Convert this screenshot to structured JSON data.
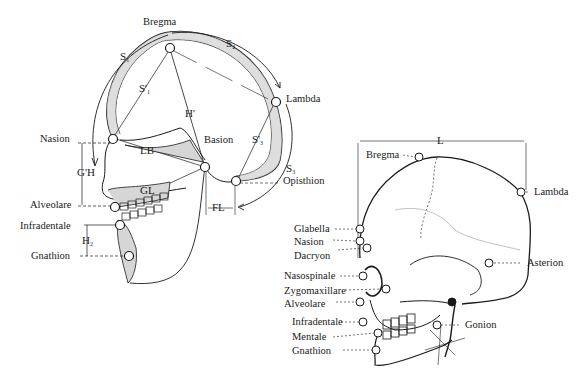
{
  "figure": {
    "left_view": {
      "title": "Median sagittal section of skull",
      "landmarks": [
        {
          "key": "bregma",
          "label": "Bregma"
        },
        {
          "key": "lambda",
          "label": "Lambda"
        },
        {
          "key": "nasion",
          "label": "Nasion"
        },
        {
          "key": "basion",
          "label": "Basion"
        },
        {
          "key": "opisthion",
          "label": "Opisthion"
        },
        {
          "key": "alveolare",
          "label": "Alveolare"
        },
        {
          "key": "infradentale",
          "label": "Infradentale"
        },
        {
          "key": "gnathion",
          "label": "Gnathion"
        }
      ],
      "measurements": [
        {
          "key": "s1",
          "label": "S",
          "sub": "1"
        },
        {
          "key": "s2",
          "label": "S",
          "sub": "2"
        },
        {
          "key": "s3",
          "label": "S",
          "sub": "3"
        },
        {
          "key": "s1_chord",
          "label": "S'",
          "sub": "1"
        },
        {
          "key": "s3_chord",
          "label": "S'",
          "sub": "3"
        },
        {
          "key": "h_prime",
          "label": "H'"
        },
        {
          "key": "lb",
          "label": "LB"
        },
        {
          "key": "gh",
          "label": "G'H"
        },
        {
          "key": "gl",
          "label": "GL"
        },
        {
          "key": "fl",
          "label": "FL"
        },
        {
          "key": "h2",
          "label": "H",
          "sub": "2"
        }
      ]
    },
    "right_view": {
      "title": "Lateral view of skull",
      "length_label": "L",
      "landmarks": [
        {
          "key": "bregma",
          "label": "Bregma"
        },
        {
          "key": "lambda",
          "label": "Lambda"
        },
        {
          "key": "glabella",
          "label": "Glabella"
        },
        {
          "key": "nasion",
          "label": "Nasion"
        },
        {
          "key": "dacryon",
          "label": "Dacryon"
        },
        {
          "key": "asterion",
          "label": "Asterion"
        },
        {
          "key": "nasospinale",
          "label": "Nasospinale"
        },
        {
          "key": "zygomaxillare",
          "label": "Zygomaxillare"
        },
        {
          "key": "alveolare",
          "label": "Alveolare"
        },
        {
          "key": "infradentale",
          "label": "Infradentale"
        },
        {
          "key": "mentale",
          "label": "Mentale"
        },
        {
          "key": "gnathion",
          "label": "Gnathion"
        },
        {
          "key": "gonion",
          "label": "Gonion"
        }
      ]
    }
  }
}
